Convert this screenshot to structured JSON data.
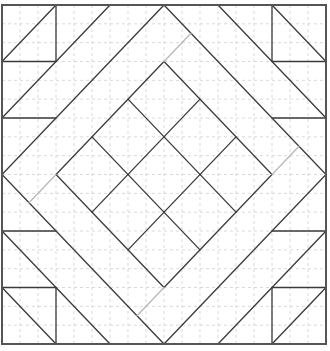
{
  "diagram": {
    "title": "",
    "type": "quilt-block",
    "grid": {
      "units": 6,
      "subdivisions_per_unit": 3,
      "color": "#d9d9d9"
    },
    "colors": {
      "seam": "#3a3a3a",
      "seam_light": "#b8b8b8",
      "frame": "#555555",
      "background": "#ffffff"
    },
    "frame": [
      0,
      0,
      6,
      6
    ],
    "seams": [
      [
        1,
        0,
        1,
        1
      ],
      [
        0,
        1,
        1,
        1
      ],
      [
        0,
        1,
        1,
        0
      ],
      [
        0,
        2,
        2,
        0
      ],
      [
        0,
        2,
        1,
        2
      ],
      [
        5,
        0,
        5,
        1
      ],
      [
        5,
        1,
        6,
        1
      ],
      [
        5,
        0,
        6,
        1
      ],
      [
        4,
        0,
        6,
        2
      ],
      [
        5,
        2,
        6,
        2
      ],
      [
        0,
        5,
        1,
        5
      ],
      [
        1,
        5,
        1,
        6
      ],
      [
        0,
        5,
        1,
        6
      ],
      [
        0,
        4,
        2,
        6
      ],
      [
        0,
        4,
        1,
        4
      ],
      [
        5,
        5,
        6,
        5
      ],
      [
        5,
        5,
        5,
        6
      ],
      [
        5,
        6,
        6,
        5
      ],
      [
        4,
        6,
        6,
        4
      ],
      [
        5,
        4,
        6,
        4
      ]
    ],
    "outer_diamond": [
      [
        3,
        0
      ],
      [
        6,
        3
      ],
      [
        3,
        6
      ],
      [
        0,
        3
      ]
    ],
    "inner_diamond": [
      [
        3,
        1
      ],
      [
        5,
        3
      ],
      [
        3,
        5
      ],
      [
        1,
        3
      ]
    ],
    "inner_grid_divisions": 3,
    "light_connectors": [
      [
        3,
        1,
        3.5,
        0.5
      ],
      [
        5,
        3,
        5.5,
        2.5
      ],
      [
        3,
        5,
        2.5,
        5.5
      ],
      [
        1,
        3,
        0.5,
        3.5
      ]
    ]
  }
}
